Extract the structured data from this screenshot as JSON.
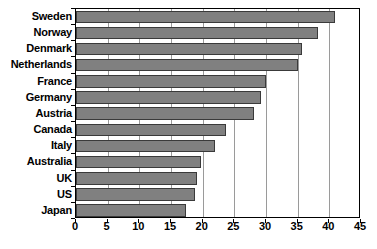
{
  "chart_data": {
    "type": "bar",
    "orientation": "horizontal",
    "title": "",
    "xlabel": "",
    "ylabel": "",
    "xlim": [
      0,
      45
    ],
    "xticks": [
      0,
      5,
      10,
      15,
      20,
      25,
      30,
      35,
      40,
      45
    ],
    "grid": true,
    "grid_axis": "x",
    "legend": false,
    "bar_color": "#808080",
    "bar_edge_color": "#3a3a3a",
    "background_color": "#ffffff",
    "axis_color": "#000000",
    "gridline_color": "#9a9a9a",
    "categories": [
      "Sweden",
      "Norway",
      "Denmark",
      "Netherlands",
      "France",
      "Germany",
      "Austria",
      "Canada",
      "Italy",
      "Australia",
      "UK",
      "US",
      "Japan"
    ],
    "values": [
      40.9,
      38.2,
      35.7,
      35.0,
      30.0,
      29.2,
      28.1,
      23.7,
      22.0,
      19.7,
      19.1,
      18.8,
      17.4
    ]
  }
}
